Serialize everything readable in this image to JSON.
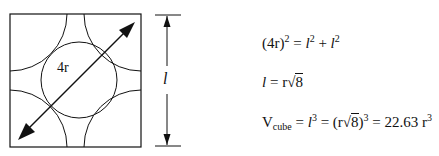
{
  "diagram": {
    "type": "fcc-unit-cell-face",
    "diagonal_label": "4r",
    "side_label": "l",
    "colors": {
      "stroke": "#111111",
      "background": "#ffffff"
    }
  },
  "equations": {
    "eq1": {
      "lhs": "(4r)",
      "lhs_exp": "2",
      "eq": " = ",
      "t1": "l",
      "t1_exp": "2",
      "plus": " + ",
      "t2": "l",
      "t2_exp": "2"
    },
    "eq2": {
      "lhs": "l",
      "eq": " = r",
      "radical": "√",
      "radicand": "8"
    },
    "eq3": {
      "v": "V",
      "v_sub": "cube",
      "eq1": " = ",
      "l": "l",
      "l_exp": "3",
      "eq2": " = (r",
      "radical": "√",
      "radicand": "8",
      "close": ")",
      "close_exp": "3",
      "eq3": " = 22.63 r",
      "r_exp": "3"
    }
  }
}
